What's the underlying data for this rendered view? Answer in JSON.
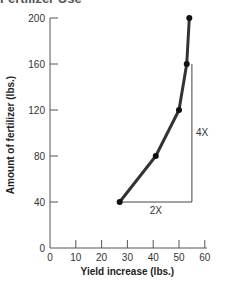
{
  "title_fragment": "Fertilizer Use",
  "chart_data": {
    "type": "line",
    "title": "",
    "xlabel": "Yield increase (lbs.)",
    "ylabel": "Amount of fertilizer (lbs.)",
    "xlim": [
      0,
      60
    ],
    "ylim": [
      0,
      200
    ],
    "x_ticks": [
      0,
      10,
      20,
      30,
      40,
      50,
      60
    ],
    "y_ticks": [
      0,
      40,
      80,
      120,
      160,
      200
    ],
    "grid": false,
    "legend": null,
    "series": [
      {
        "name": "Fertilizer vs yield",
        "x": [
          27,
          41,
          50,
          53,
          54
        ],
        "y": [
          40,
          80,
          120,
          160,
          200
        ],
        "markers": true
      }
    ],
    "annotations": [
      {
        "text": "2X",
        "description": "horizontal leg of triangle from (27,40) to (55,40)"
      },
      {
        "text": "4X",
        "description": "vertical leg of triangle from (55,40) to (55,160)"
      }
    ],
    "triangle": {
      "x0": 27,
      "x1": 55,
      "y0": 40,
      "y1": 160
    }
  },
  "colors": {
    "curve": "#333333",
    "axis": "#555555",
    "triangle": "#444444"
  }
}
